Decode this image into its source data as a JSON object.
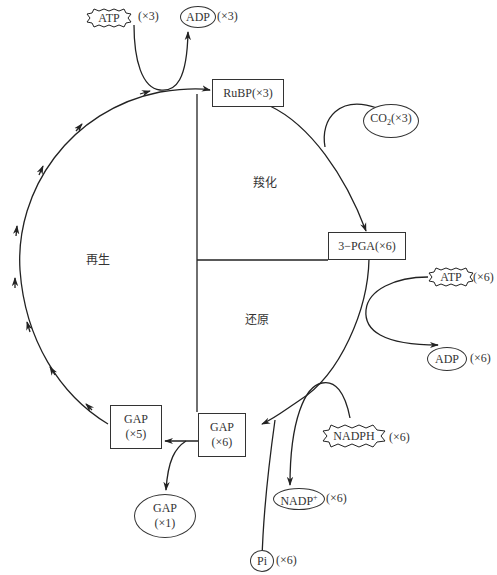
{
  "diagram": {
    "phases": {
      "carboxylation": "羧化",
      "reduction": "还原",
      "regeneration": "再生"
    },
    "nodes": {
      "rubp": "RuBP(×3)",
      "pga": "3−PGA(×6)",
      "gap6_name": "GAP",
      "gap6_count": "(×6)",
      "gap5_name": "GAP",
      "gap5_count": "(×5)",
      "gap1_name": "GAP",
      "gap1_count": "(×1)"
    },
    "inputs_outputs": {
      "co2": "CO",
      "co2_sub": "2",
      "co2_count": "(×3)",
      "atp_top": "ATP",
      "atp_top_count": "(×3)",
      "adp_top": "ADP",
      "adp_top_count": "(×3)",
      "atp_right": "ATP",
      "atp_right_count": "(×6)",
      "adp_right": "ADP",
      "adp_right_count": "(×6)",
      "nadph": "NADPH",
      "nadph_count": "(×6)",
      "nadp": "NADP",
      "nadp_sup": "+",
      "nadp_count": "(×6)",
      "pi": "Pi",
      "pi_count": "(×6)"
    },
    "colors": {
      "line": "#222222",
      "background": "#ffffff"
    }
  }
}
